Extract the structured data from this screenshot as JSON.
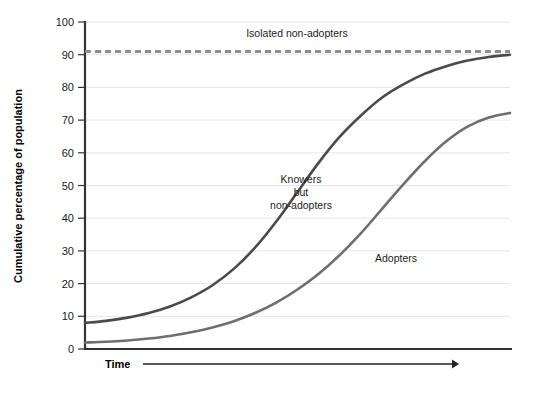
{
  "chart_data": {
    "type": "line",
    "title": "",
    "subtitle": "",
    "xlabel": "Time",
    "ylabel": "Cumulative percentage of population",
    "xlim": [
      0,
      100
    ],
    "ylim": [
      0,
      100
    ],
    "grid": true,
    "legend_position": "inline-annotations",
    "x_tick_labels": [],
    "y_tick_labels": [
      "0",
      "10",
      "20",
      "30",
      "40",
      "50",
      "60",
      "70",
      "80",
      "90",
      "100"
    ],
    "y_ticks": [
      0,
      10,
      20,
      30,
      40,
      50,
      60,
      70,
      80,
      90,
      100
    ],
    "x": [
      0,
      5,
      10,
      15,
      20,
      25,
      30,
      35,
      40,
      45,
      50,
      55,
      60,
      65,
      70,
      75,
      80,
      85,
      90,
      95,
      100
    ],
    "series": [
      {
        "name": "Isolated non-adopters",
        "style": "dashed",
        "color": "#8c8c8c",
        "width": 3,
        "values": [
          91,
          91,
          91,
          91,
          91,
          91,
          91,
          91,
          91,
          91,
          91,
          91,
          91,
          91,
          91,
          91,
          91,
          91,
          91,
          91,
          91
        ],
        "label_x": 57,
        "label_y": 96
      },
      {
        "name": "Knowers but non-adopters",
        "style": "solid",
        "color": "#4a4a4a",
        "width": 2.6,
        "values": [
          8,
          8.6,
          9.6,
          11,
          13,
          15.8,
          19.5,
          24.5,
          31,
          39,
          48,
          57,
          65,
          71.5,
          77,
          81,
          84.2,
          86.5,
          88.2,
          89.3,
          90
        ],
        "label_x": 45,
        "label_y": 50,
        "label_lines": [
          "Knowers",
          "but",
          "non-adopters"
        ]
      },
      {
        "name": "Adopters",
        "style": "solid",
        "color": "#6e6e6e",
        "width": 2.6,
        "values": [
          2,
          2.2,
          2.6,
          3.2,
          4,
          5.1,
          6.6,
          8.5,
          11,
          14.2,
          18.2,
          23,
          28.8,
          35.5,
          43,
          50.5,
          57.5,
          63.5,
          68,
          70.8,
          72.2
        ],
        "label_x": 74,
        "label_y": 26
      }
    ],
    "annotations": [
      {
        "text": "Isolated non-adopters",
        "x": 57,
        "y": 96
      },
      {
        "text": "Knowers",
        "x": 45,
        "y": 54
      },
      {
        "text": "but",
        "x": 45,
        "y": 50
      },
      {
        "text": "non-adopters",
        "x": 45,
        "y": 46
      },
      {
        "text": "Adopters",
        "x": 74,
        "y": 26
      }
    ]
  },
  "labels": {
    "y_axis_title": "Cumulative percentage of population",
    "x_axis_title": "Time",
    "isolated_non_adopters": "Isolated non-adopters",
    "knowers_line1": "Knowers",
    "knowers_line2": "but",
    "knowers_line3": "non-adopters",
    "adopters": "Adopters",
    "y_100": "100",
    "y_90": "90",
    "y_80": "80",
    "y_70": "70",
    "y_60": "60",
    "y_50": "50",
    "y_40": "40",
    "y_30": "30",
    "y_20": "20",
    "y_10": "10",
    "y_0": "0"
  },
  "colors": {
    "dashed_series": "#8c8c8c",
    "dark_series": "#4a4a4a",
    "light_series": "#6e6e6e",
    "gridline": "#e6e6e6",
    "axis": "#333333",
    "text": "#1a1a1a",
    "background": "#ffffff"
  }
}
